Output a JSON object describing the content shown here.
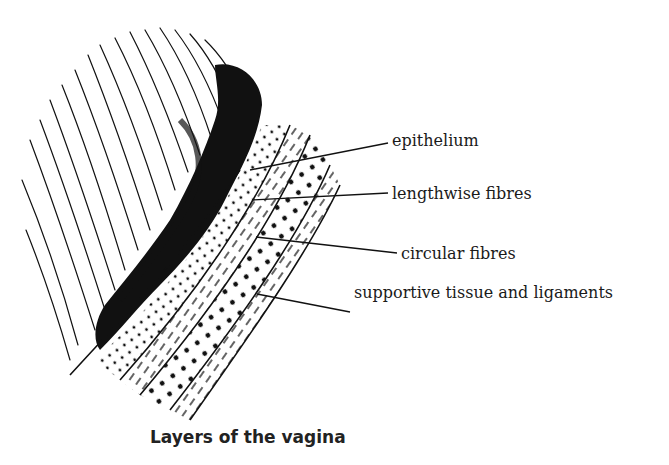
{
  "figure": {
    "caption": "Layers of the vagina",
    "labels": [
      {
        "id": "epithelium",
        "text": "epithelium",
        "x": 392,
        "y": 131
      },
      {
        "id": "lengthwise",
        "text": "lengthwise fibres",
        "x": 392,
        "y": 186
      },
      {
        "id": "circular",
        "text": "circular fibres",
        "x": 401,
        "y": 246
      },
      {
        "id": "supportive",
        "text": "supportive tissue and ligaments",
        "x": 354,
        "y": 284
      }
    ],
    "colors": {
      "ink": "#111111",
      "background": "#ffffff"
    }
  }
}
